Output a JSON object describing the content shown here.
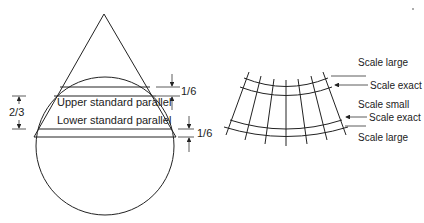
{
  "cone_diagram": {
    "labels": {
      "upper_parallel": "Upper standard parallel",
      "lower_parallel": "Lower standard parallel",
      "left_fraction": "2/3",
      "top_right_fraction": "1/6",
      "bottom_right_fraction": "1/6"
    }
  },
  "grid_diagram": {
    "labels": {
      "scale_large_top": "Scale large",
      "scale_exact_upper": "Scale exact",
      "scale_small": "Scale small",
      "scale_exact_lower": "Scale exact",
      "scale_large_bottom": "Scale large"
    }
  },
  "colors": {
    "line": "#222222",
    "background": "#ffffff"
  }
}
